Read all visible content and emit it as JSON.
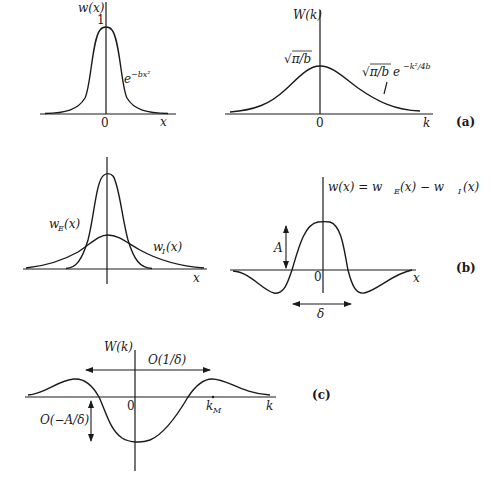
{
  "panels": {
    "a": {
      "label": "(a)",
      "left": {
        "y_axis_label": "w(x)",
        "x_axis_label": "x",
        "origin_label": "0",
        "peak_label": "1",
        "curve_label_base": "e",
        "curve_label_exp": "−bx²"
      },
      "right": {
        "y_axis_label": "W(k)",
        "x_axis_label": "k",
        "origin_label": "0",
        "peak_label": "√π/b",
        "curve_label_base": "√π/b e",
        "curve_label_exp": "−k²/4b"
      }
    },
    "b": {
      "label": "(b)",
      "left": {
        "x_axis_label": "x",
        "excitatory_label": "w",
        "excitatory_sub": "E",
        "excitatory_arg": "(x)",
        "inhibitory_label": "w",
        "inhibitory_sub": "I",
        "inhibitory_arg": "(x)"
      },
      "right": {
        "equation": "w(x) = w_E(x) − w_I(x)",
        "eq_part1": "w(x) = w",
        "eq_sub1": "E",
        "eq_part2": "(x) − w",
        "eq_sub2": "I",
        "eq_part3": "(x)",
        "x_axis_label": "x",
        "origin_label": "0",
        "amplitude_label": "A",
        "width_label": "δ"
      }
    },
    "c": {
      "label": "(c)",
      "y_axis_label": "W(k)",
      "x_axis_label": "k",
      "origin_label": "0",
      "peak_k_label": "k",
      "peak_k_sub": "M",
      "span_label": "O(1/δ)",
      "depth_label": "O(−A/δ)"
    }
  }
}
